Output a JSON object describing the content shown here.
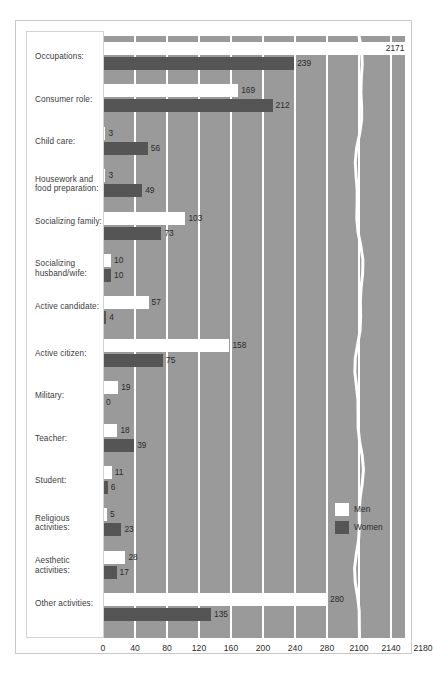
{
  "chart_data": {
    "type": "bar",
    "orientation": "horizontal",
    "title": "",
    "subtitle": "",
    "xlabel": "",
    "ylabel": "",
    "grid": true,
    "legend_position": "center-right",
    "axis_break": {
      "present": true,
      "between": [
        280,
        2100
      ],
      "style": "wavy-white-line"
    },
    "xticks": [
      {
        "label": "0",
        "value": 0
      },
      {
        "label": "40",
        "value": 40
      },
      {
        "label": "80",
        "value": 80
      },
      {
        "label": "120",
        "value": 120
      },
      {
        "label": "160",
        "value": 160
      },
      {
        "label": "200",
        "value": 200
      },
      {
        "label": "240",
        "value": 240
      },
      {
        "label": "280",
        "value": 280
      },
      {
        "label": "2100",
        "value": 2100
      },
      {
        "label": "2140",
        "value": 2140
      },
      {
        "label": "2180",
        "value": 2180
      }
    ],
    "xlim": [
      0,
      2180
    ],
    "categories": [
      "Occupations:",
      "Consumer role:",
      "Child care:",
      "Housework and food preparation:",
      "Socializing family:",
      "Socializing husband/wife:",
      "Active candidate:",
      "Active citizen:",
      "Military:",
      "Teacher:",
      "Student:",
      "Religious activities:",
      "Aesthetic activities:",
      "Other activities:"
    ],
    "series": [
      {
        "name": "Men",
        "color": "#ffffff",
        "values": [
          2171,
          169,
          3,
          3,
          103,
          10,
          57,
          158,
          19,
          18,
          11,
          5,
          28,
          280
        ]
      },
      {
        "name": "Women",
        "color": "#555555",
        "values": [
          239,
          212,
          56,
          49,
          73,
          10,
          4,
          75,
          0,
          39,
          6,
          23,
          17,
          135
        ]
      }
    ]
  },
  "legend": {
    "items": [
      {
        "label": "Men",
        "swatch": "men"
      },
      {
        "label": "Women",
        "swatch": "women"
      }
    ]
  },
  "colors": {
    "plot_background": "#9a9a9a",
    "gridline": "#ffffff",
    "men_bar": "#ffffff",
    "women_bar": "#555555",
    "label_text": "#3c3c3c",
    "frame": "#c9c9c9",
    "page_background": "#ffffff"
  }
}
